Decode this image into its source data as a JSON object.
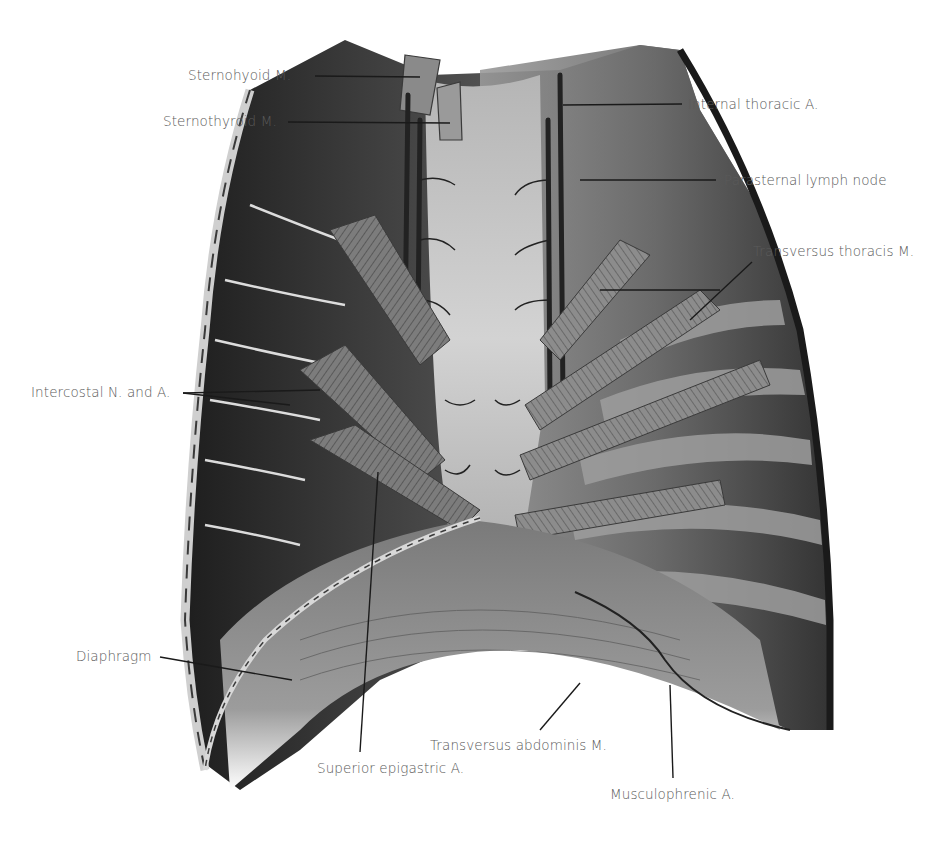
{
  "figure": {
    "colors": {
      "background": "#ffffff",
      "label_text": "#5a5a5a",
      "leader_line": "#1a1a1a",
      "tissue_dark": "#2a2a2a",
      "tissue_mid": "#6e6e6e",
      "tissue_light": "#bdbdbd",
      "sternum": "#c9c9c9"
    }
  },
  "labels": {
    "sternohyoid": "Sternohyoid M.",
    "sternothyroid": "Sternothyroid M.",
    "internal_thoracic": "Internal thoracic A.",
    "parasternal_lymph": "Parasternal lymph node",
    "transversus_thoracis": "Transversus thoracis M.",
    "intercostal": "Intercostal N. and A.",
    "diaphragm": "Diaphragm",
    "transversus_abdominis": "Transversus abdominis M.",
    "superior_epigastric": "Superior epigastric A.",
    "musculophrenic": "Musculophrenic A."
  }
}
